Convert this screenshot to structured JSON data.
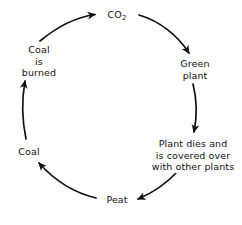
{
  "diagram": {
    "stroke_color": "#111111",
    "background_color": "#ffffff",
    "nodes": [
      {
        "id": "co2",
        "lines": [
          "CO",
          "2"
        ],
        "text": "CO2",
        "line1": "CO",
        "subscript": "2",
        "position": "top"
      },
      {
        "id": "green-plant",
        "line1": "Green",
        "line2": "plant",
        "text": "Green plant",
        "position": "upper-right"
      },
      {
        "id": "plant-dies",
        "line1": "Plant dies and",
        "line2": "is covered over",
        "line3": "with other plants",
        "text": "Plant dies and is covered over with other plants",
        "position": "lower-right"
      },
      {
        "id": "peat",
        "line1": "Peat",
        "text": "Peat",
        "position": "bottom"
      },
      {
        "id": "coal",
        "line1": "Coal",
        "text": "Coal",
        "position": "lower-left"
      },
      {
        "id": "coal-is-burned",
        "line1": "Coal",
        "line2": "is",
        "line3": "burned",
        "text": "Coal is burned",
        "position": "upper-left"
      }
    ],
    "arrows": [
      {
        "id": "arrow-coal-burned-to-co2",
        "from": "coal-is-burned",
        "to": "co2"
      },
      {
        "id": "arrow-co2-to-green-plant",
        "from": "co2",
        "to": "green-plant"
      },
      {
        "id": "arrow-green-plant-to-plant-dies",
        "from": "green-plant",
        "to": "plant-dies"
      },
      {
        "id": "arrow-plant-dies-to-peat",
        "from": "plant-dies",
        "to": "peat"
      },
      {
        "id": "arrow-peat-to-coal",
        "from": "peat",
        "to": "coal"
      },
      {
        "id": "arrow-coal-to-coal-burned",
        "from": "coal",
        "to": "coal-is-burned"
      }
    ]
  }
}
